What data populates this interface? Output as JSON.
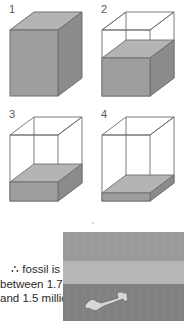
{
  "figure": {
    "panels": [
      {
        "number": "1",
        "fill_fraction": 1.0,
        "state": "full"
      },
      {
        "number": "2",
        "fill_fraction": 0.58,
        "state": "half"
      },
      {
        "number": "3",
        "fill_fraction": 0.28,
        "state": "quarter"
      },
      {
        "number": "4",
        "fill_fraction": 0.12,
        "state": "eighth"
      }
    ]
  },
  "caption": {
    "line1": "∴ fossil is",
    "line2": "between 1.75",
    "line3": "and 1.5 million"
  },
  "strata": {
    "layers": [
      {
        "name": "top-layer",
        "color": "#9a9a9a",
        "height_fraction": 0.33
      },
      {
        "name": "middle-layer",
        "color": "#b6b6b6",
        "height_fraction": 0.26
      },
      {
        "name": "bottom-layer",
        "color": "#818181",
        "height_fraction": 0.41
      }
    ],
    "fossil": {
      "name": "bone",
      "color": "#d5d5d5"
    }
  },
  "colors": {
    "outline": "#6d6d6d",
    "fill_front": "#9d9d9d",
    "fill_side": "#8a8a8a",
    "fill_top": "#b3b3b3",
    "label": "#58585a",
    "text": "#2a2a2a",
    "background": "#ffffff"
  }
}
